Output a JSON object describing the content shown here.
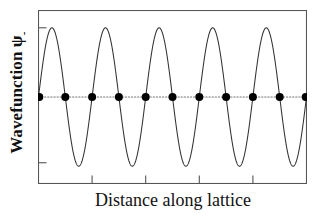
{
  "figure": {
    "width": 322,
    "height": 216,
    "background": "#ffffff"
  },
  "axes": {
    "ylabel_prefix": "Wavefunction ",
    "ylabel_symbol": "ψ",
    "ylabel_subscript": "-",
    "ylabel_full": "Wavefunction ψ-",
    "xlabel": "Distance along lattice",
    "frame_color": "#555555",
    "tick_color": "#555555"
  },
  "chart_data": {
    "type": "line",
    "title": "",
    "xlabel": "Distance along lattice",
    "ylabel": "Wavefunction ψ-",
    "subtitle": "",
    "grid": false,
    "legend": null,
    "xlim": [
      0,
      10
    ],
    "ylim": [
      -1.25,
      1.25
    ],
    "xticks": [
      2,
      4,
      6,
      8
    ],
    "xticklabels": [
      "",
      "",
      "",
      ""
    ],
    "yticks": [
      1,
      -0.95
    ],
    "yticklabels": [
      "",
      ""
    ],
    "annotations": [],
    "series": [
      {
        "name": "wavefunction",
        "type": "line",
        "color": "#333333",
        "linewidth": 1,
        "description": "Antibonding-type sine wave, psi = sin(pi*x), five full periods across ten lattice sites, zero at every lattice atom",
        "form": "sin",
        "amplitude": 1.0,
        "periods": 5,
        "phase": 0,
        "x": [
          0,
          0.25,
          0.5,
          0.75,
          1,
          1.25,
          1.5,
          1.75,
          2,
          2.25,
          2.5,
          2.75,
          3,
          3.25,
          3.5,
          3.75,
          4,
          4.25,
          4.5,
          4.75,
          5,
          5.25,
          5.5,
          5.75,
          6,
          6.25,
          6.5,
          6.75,
          7,
          7.25,
          7.5,
          7.75,
          8,
          8.25,
          8.5,
          8.75,
          9,
          9.25,
          9.5,
          9.75,
          10
        ],
        "y": [
          0,
          0.707,
          1,
          0.707,
          0,
          -0.707,
          -1,
          -0.707,
          0,
          0.707,
          1,
          0.707,
          0,
          -0.707,
          -1,
          -0.707,
          0,
          0.707,
          1,
          0.707,
          0,
          -0.707,
          -1,
          -0.707,
          0,
          0.707,
          1,
          0.707,
          0,
          -0.707,
          -1,
          -0.707,
          0,
          0.707,
          1,
          0.707,
          0,
          -0.707,
          -1,
          -0.707,
          0
        ]
      },
      {
        "name": "lattice-atoms",
        "type": "scatter",
        "color": "#000000",
        "marker": "circle",
        "marker_size": 8,
        "description": "Eleven lattice atom positions lying on the zero line",
        "x": [
          0,
          1,
          2,
          3,
          4,
          5,
          6,
          7,
          8,
          9,
          10
        ],
        "y": [
          0,
          0,
          0,
          0,
          0,
          0,
          0,
          0,
          0,
          0,
          0
        ]
      },
      {
        "name": "zero-line",
        "type": "line",
        "style": "dotted",
        "color": "#777777",
        "description": "Dotted horizontal baseline at psi = 0 running through the lattice atoms",
        "x": [
          0,
          10
        ],
        "y": [
          0,
          0
        ]
      }
    ]
  }
}
